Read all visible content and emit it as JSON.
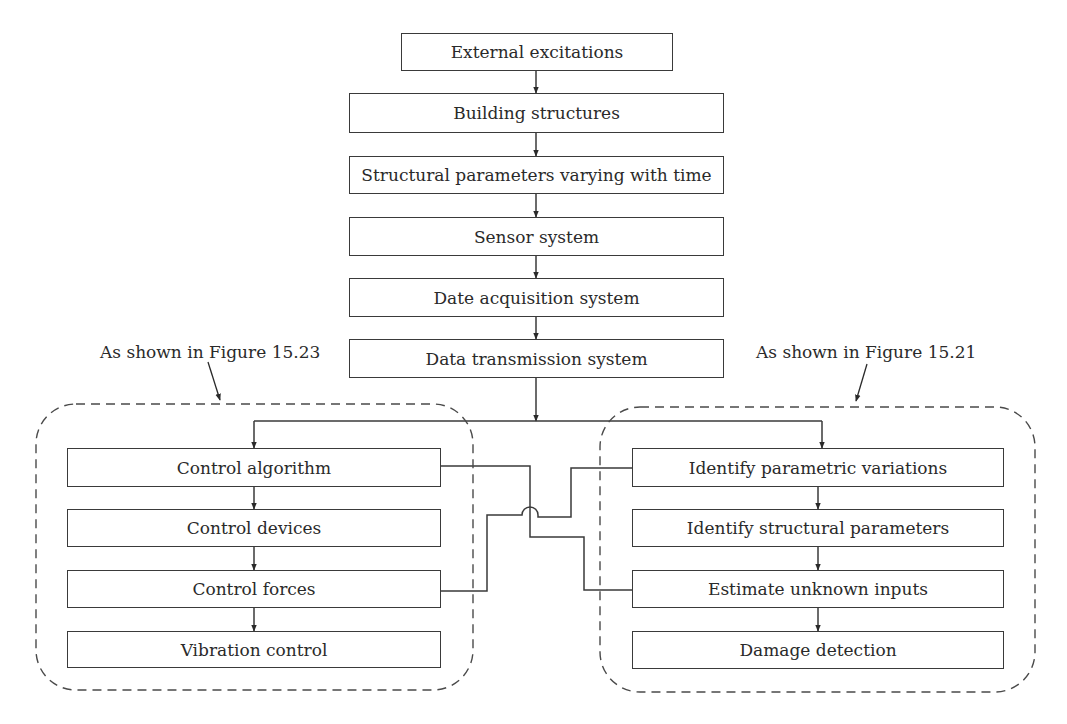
{
  "diagram": {
    "main_flow": [
      {
        "id": "external",
        "label": "External excitations"
      },
      {
        "id": "building",
        "label": "Building structures"
      },
      {
        "id": "structural",
        "label": "Structural parameters varying with time"
      },
      {
        "id": "sensor",
        "label": "Sensor system"
      },
      {
        "id": "daq",
        "label": "Date acquisition system"
      },
      {
        "id": "transmission",
        "label": "Data transmission system"
      }
    ],
    "left_group": {
      "annotation": "As shown in Figure 15.23",
      "items": [
        {
          "id": "control-algorithm",
          "label": "Control algorithm"
        },
        {
          "id": "control-devices",
          "label": "Control devices"
        },
        {
          "id": "control-forces",
          "label": "Control forces"
        },
        {
          "id": "vibration-control",
          "label": "Vibration control"
        }
      ]
    },
    "right_group": {
      "annotation": "As shown in Figure 15.21",
      "items": [
        {
          "id": "identify-parametric",
          "label": "Identify parametric variations"
        },
        {
          "id": "identify-structural",
          "label": "Identify structural parameters"
        },
        {
          "id": "estimate-inputs",
          "label": "Estimate unknown inputs"
        },
        {
          "id": "damage-detection",
          "label": "Damage detection"
        }
      ]
    },
    "cross_links": [
      {
        "from": "Control algorithm",
        "to": "Estimate unknown inputs"
      },
      {
        "from": "Control forces",
        "to": "Identify parametric variations"
      }
    ],
    "colors": {
      "line": "#3a3a3a",
      "text": "#2a2a2a",
      "background": "#ffffff"
    }
  }
}
